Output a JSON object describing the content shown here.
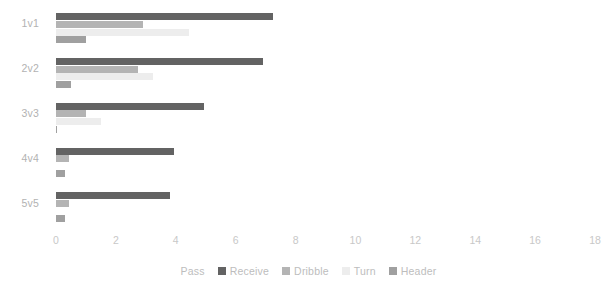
{
  "chart_data": {
    "type": "bar",
    "orientation": "horizontal",
    "title": "",
    "xlabel": "",
    "ylabel": "",
    "categories": [
      "1v1",
      "2v2",
      "3v3",
      "4v4",
      "5v5"
    ],
    "xticks": [
      0,
      2,
      4,
      6,
      8,
      10,
      12,
      14,
      16,
      18
    ],
    "xlim": [
      0,
      18
    ],
    "grid": false,
    "legend_position": "bottom",
    "series": [
      {
        "name": "Pass",
        "color": "#ffffff",
        "values": [
          0,
          0,
          0,
          0,
          0
        ]
      },
      {
        "name": "Receive",
        "color": "#636363",
        "values": [
          7.25,
          6.9,
          4.95,
          3.95,
          3.8
        ]
      },
      {
        "name": "Dribble",
        "color": "#b4b4b4",
        "values": [
          2.9,
          2.75,
          1.0,
          0.45,
          0.45
        ]
      },
      {
        "name": "Turn",
        "color": "#ededed",
        "values": [
          4.45,
          3.25,
          1.5,
          0.0,
          0.0
        ]
      },
      {
        "name": "Header",
        "color": "#a0a0a0",
        "values": [
          1.0,
          0.5,
          0.05,
          0.3,
          0.3
        ]
      }
    ]
  },
  "axis": {
    "tick_color": "#c8c8c8",
    "category_label_color": "#b2b2b2"
  },
  "legend": {
    "items": [
      "Pass",
      "Receive",
      "Dribble",
      "Turn",
      "Header"
    ]
  }
}
